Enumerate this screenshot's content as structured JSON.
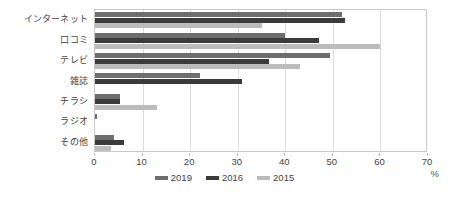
{
  "chart_data": {
    "type": "bar",
    "orientation": "horizontal",
    "title": "",
    "subtitle": "",
    "xlabel": "%",
    "ylabel": "",
    "xlim": [
      0,
      70
    ],
    "xticks": [
      0,
      10,
      20,
      30,
      40,
      50,
      60,
      70
    ],
    "grid": true,
    "grid_axis": "x",
    "legend_position": "bottom",
    "categories": [
      "インターネット",
      "口コミ",
      "テレビ",
      "雑誌",
      "チラシ",
      "ラジオ",
      "その他"
    ],
    "series": [
      {
        "name": "2019",
        "color": "#6e6e6e",
        "values": [
          52.0,
          40.0,
          49.5,
          22.0,
          5.3,
          0.5,
          4.0
        ]
      },
      {
        "name": "2016",
        "color": "#3b3b3b",
        "values": [
          52.5,
          47.0,
          36.5,
          31.0,
          5.3,
          0.0,
          6.0
        ]
      },
      {
        "name": "2015",
        "color": "#bcbcbc",
        "values": [
          35.0,
          60.0,
          43.0,
          0.0,
          13.0,
          0.0,
          3.3
        ]
      }
    ]
  },
  "axis": {
    "x_unit_label": "%",
    "tick_labels": [
      "0",
      "10",
      "20",
      "30",
      "40",
      "50",
      "60",
      "70"
    ]
  },
  "legend": {
    "items": [
      {
        "label": "2019"
      },
      {
        "label": "2016"
      },
      {
        "label": "2015"
      }
    ]
  }
}
